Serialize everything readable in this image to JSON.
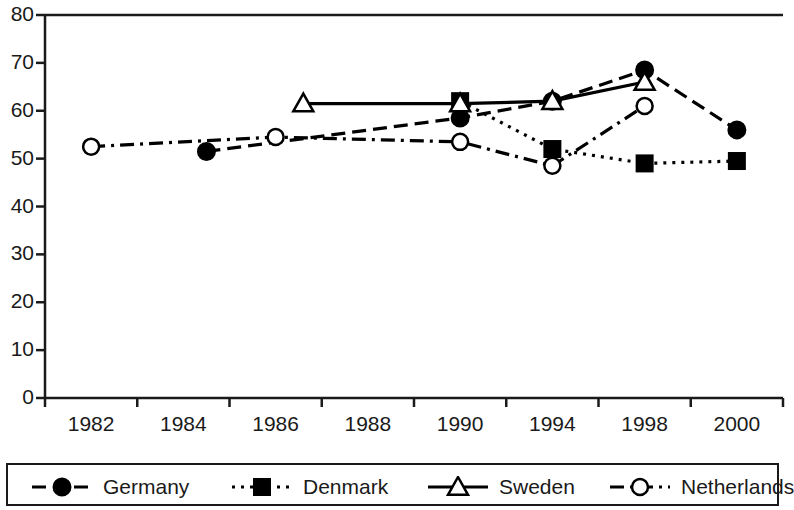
{
  "chart_data": {
    "type": "line",
    "title": "",
    "subtitle": "",
    "xlabel": "",
    "ylabel": "",
    "categories": [
      "1982",
      "1984",
      "1986",
      "1988",
      "1990",
      "1994",
      "1998",
      "2000"
    ],
    "ylim": [
      0,
      80
    ],
    "yticks": [
      "0",
      "10",
      "20",
      "30",
      "40",
      "50",
      "60",
      "70",
      "80"
    ],
    "grid": false,
    "legend_position": "bottom",
    "series": [
      {
        "name": "Germany",
        "line_style": "dashed",
        "marker": "filled-circle",
        "color": "#000000",
        "points": [
          {
            "x": "1984",
            "x_offset": 0.25,
            "y": 51.5
          },
          {
            "x": "1990",
            "x_offset": 0.0,
            "y": 58.5
          },
          {
            "x": "1994",
            "x_offset": 0.0,
            "y": 62.0
          },
          {
            "x": "1998",
            "x_offset": 0.0,
            "y": 68.5
          },
          {
            "x": "2000",
            "x_offset": 0.0,
            "y": 56.0
          }
        ]
      },
      {
        "name": "Denmark",
        "line_style": "dotted",
        "marker": "filled-square",
        "color": "#000000",
        "points": [
          {
            "x": "1990",
            "x_offset": 0.0,
            "y": 62.0
          },
          {
            "x": "1994",
            "x_offset": 0.0,
            "y": 52.0
          },
          {
            "x": "1998",
            "x_offset": 0.0,
            "y": 49.0
          },
          {
            "x": "2000",
            "x_offset": 0.0,
            "y": 49.5
          }
        ]
      },
      {
        "name": "Sweden",
        "line_style": "solid",
        "marker": "open-triangle",
        "color": "#000000",
        "points": [
          {
            "x": "1986",
            "x_offset": 0.3,
            "y": 61.5
          },
          {
            "x": "1990",
            "x_offset": 0.0,
            "y": 61.5
          },
          {
            "x": "1994",
            "x_offset": 0.0,
            "y": 62.0
          },
          {
            "x": "1998",
            "x_offset": 0.0,
            "y": 66.0
          }
        ]
      },
      {
        "name": "Netherlands",
        "line_style": "dash-dot",
        "marker": "open-circle",
        "color": "#000000",
        "points": [
          {
            "x": "1982",
            "x_offset": 0.0,
            "y": 52.5
          },
          {
            "x": "1986",
            "x_offset": 0.0,
            "y": 54.5
          },
          {
            "x": "1990",
            "x_offset": 0.0,
            "y": 53.5
          },
          {
            "x": "1994",
            "x_offset": 0.0,
            "y": 48.5
          },
          {
            "x": "1998",
            "x_offset": 0.0,
            "y": 61.0
          }
        ]
      }
    ]
  },
  "legend": {
    "items": [
      {
        "label": "Germany",
        "style": "dashed",
        "marker": "filled-circle"
      },
      {
        "label": "Denmark",
        "style": "dotted",
        "marker": "filled-square"
      },
      {
        "label": "Sweden",
        "style": "solid",
        "marker": "open-triangle"
      },
      {
        "label": "Netherlands",
        "style": "dash-dot",
        "marker": "open-circle"
      }
    ]
  }
}
